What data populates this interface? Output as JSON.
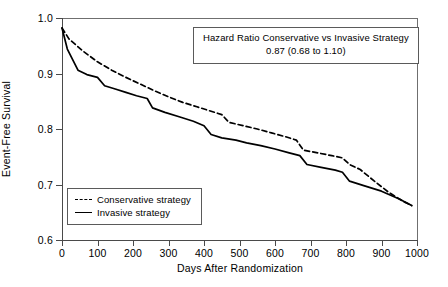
{
  "chart_data": {
    "type": "line",
    "title": "",
    "xlabel": "Days After Randomization",
    "ylabel": "Event-Free Survival",
    "xlim": [
      0,
      1000
    ],
    "ylim": [
      0.6,
      1.0
    ],
    "xticks": [
      0,
      100,
      200,
      300,
      400,
      500,
      600,
      700,
      800,
      900,
      1000
    ],
    "yticks": [
      "1.0",
      "0.9",
      "0.8",
      "0.7",
      "0.6"
    ],
    "ytick_values": [
      1.0,
      0.9,
      0.8,
      0.7,
      0.6
    ],
    "grid": false,
    "legend_position": "lower-left",
    "annotation": {
      "line1": "Hazard Ratio Conservative vs Invasive Strategy",
      "line2": "0.87 (0.68 to 1.10)",
      "hazard_ratio": 0.87,
      "ci_low": 0.68,
      "ci_high": 1.1
    },
    "series": [
      {
        "name": "Conservative strategy",
        "style": "dashed",
        "color": "#000000",
        "points": [
          [
            0,
            0.982
          ],
          [
            20,
            0.962
          ],
          [
            60,
            0.94
          ],
          [
            100,
            0.921
          ],
          [
            140,
            0.906
          ],
          [
            180,
            0.893
          ],
          [
            220,
            0.881
          ],
          [
            260,
            0.869
          ],
          [
            300,
            0.858
          ],
          [
            340,
            0.848
          ],
          [
            380,
            0.84
          ],
          [
            420,
            0.832
          ],
          [
            450,
            0.826
          ],
          [
            470,
            0.812
          ],
          [
            510,
            0.806
          ],
          [
            550,
            0.8
          ],
          [
            590,
            0.793
          ],
          [
            630,
            0.786
          ],
          [
            660,
            0.78
          ],
          [
            680,
            0.762
          ],
          [
            720,
            0.757
          ],
          [
            760,
            0.752
          ],
          [
            790,
            0.748
          ],
          [
            810,
            0.736
          ],
          [
            840,
            0.727
          ],
          [
            880,
            0.706
          ],
          [
            920,
            0.686
          ],
          [
            960,
            0.67
          ],
          [
            985,
            0.662
          ]
        ]
      },
      {
        "name": "Invasive strategy",
        "style": "solid",
        "color": "#000000",
        "points": [
          [
            0,
            0.982
          ],
          [
            15,
            0.944
          ],
          [
            45,
            0.906
          ],
          [
            70,
            0.898
          ],
          [
            100,
            0.893
          ],
          [
            120,
            0.878
          ],
          [
            150,
            0.872
          ],
          [
            180,
            0.866
          ],
          [
            210,
            0.86
          ],
          [
            240,
            0.855
          ],
          [
            255,
            0.838
          ],
          [
            290,
            0.83
          ],
          [
            330,
            0.822
          ],
          [
            370,
            0.814
          ],
          [
            400,
            0.806
          ],
          [
            420,
            0.79
          ],
          [
            450,
            0.784
          ],
          [
            490,
            0.78
          ],
          [
            520,
            0.775
          ],
          [
            560,
            0.77
          ],
          [
            600,
            0.764
          ],
          [
            640,
            0.757
          ],
          [
            670,
            0.752
          ],
          [
            690,
            0.736
          ],
          [
            730,
            0.731
          ],
          [
            770,
            0.726
          ],
          [
            790,
            0.722
          ],
          [
            810,
            0.706
          ],
          [
            850,
            0.698
          ],
          [
            900,
            0.688
          ],
          [
            950,
            0.674
          ],
          [
            985,
            0.662
          ]
        ]
      }
    ]
  },
  "legend": {
    "items": [
      {
        "label": "Conservative strategy",
        "style": "dashed"
      },
      {
        "label": "Invasive strategy",
        "style": "solid"
      }
    ]
  }
}
